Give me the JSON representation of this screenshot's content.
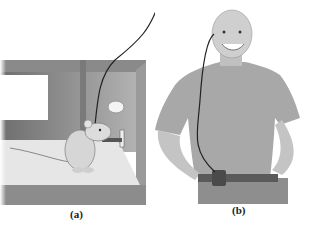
{
  "figure": {
    "panels": [
      {
        "id": "a",
        "label": "(a)",
        "subject": "rat in cage with implanted electrode pressing lever"
      },
      {
        "id": "b",
        "label": "(b)",
        "subject": "man with head electrode wire connected to belt stimulator"
      }
    ]
  },
  "colors": {
    "background": "#ffffff",
    "cage_frame": "#8a8a8a",
    "cage_wall": "#9c9c9c",
    "floor": "#e6e6e6",
    "shirt": "#a8a8a8",
    "skin": "#c8c8c8",
    "wire": "#222222"
  }
}
